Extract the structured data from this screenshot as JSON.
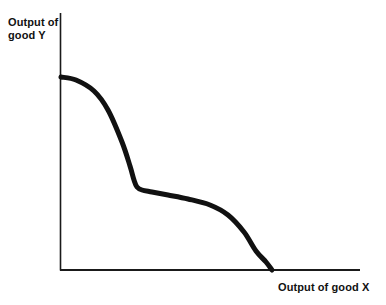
{
  "figure": {
    "name": "production-possibility-frontier",
    "background_color": "#ffffff",
    "line_color": "#111111",
    "axis_color": "#1a1a1a"
  },
  "labels": {
    "y_line1": "Output of",
    "y_line2": "good Y",
    "x": "Output of good X"
  },
  "chart_data": {
    "type": "line",
    "title": "",
    "xlabel": "Output of good X",
    "ylabel": "Output of good Y",
    "grid": false,
    "legend": null,
    "axis_ticks": {
      "x": [],
      "y": []
    },
    "axis_pixels": {
      "origin_x": 60,
      "origin_y": 270,
      "y_axis_top": 13,
      "x_axis_right": 360
    },
    "xlim": [
      0,
      1
    ],
    "ylim": [
      0,
      1
    ],
    "annotations": [
      "Concave-to-origin frontier with a flat middle plateau (step shape)"
    ],
    "series": [
      {
        "name": "frontier",
        "description": "Production possibility frontier falling from the Y intercept to the X intercept with a pronounced plateau",
        "stroke_width": 5,
        "x": [
          0.0,
          0.05,
          0.11,
          0.16,
          0.21,
          0.24,
          0.26,
          0.28,
          0.3,
          0.33,
          0.38,
          0.45,
          0.52,
          0.58,
          0.63,
          0.67,
          0.7,
          0.71
        ],
        "y": [
          0.74,
          0.73,
          0.69,
          0.62,
          0.51,
          0.42,
          0.36,
          0.33,
          0.32,
          0.31,
          0.3,
          0.28,
          0.26,
          0.22,
          0.16,
          0.09,
          0.03,
          0.0
        ],
        "points_pixels": [
          [
            61,
            77
          ],
          [
            76,
            80
          ],
          [
            94,
            91
          ],
          [
            108,
            110
          ],
          [
            122,
            142
          ],
          [
            130,
            166
          ],
          [
            134,
            180
          ],
          [
            137,
            187
          ],
          [
            142,
            190
          ],
          [
            152,
            192
          ],
          [
            168,
            195
          ],
          [
            188,
            199
          ],
          [
            210,
            205
          ],
          [
            228,
            215
          ],
          [
            244,
            232
          ],
          [
            256,
            251
          ],
          [
            266,
            262
          ],
          [
            272,
            270
          ]
        ]
      }
    ]
  }
}
